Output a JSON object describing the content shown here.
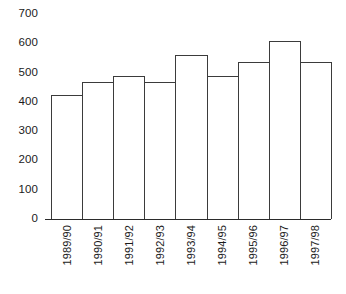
{
  "chart_data": {
    "type": "bar",
    "title": "",
    "subtitle": "",
    "xlabel": "",
    "ylabel": "",
    "categories": [
      "1989/90",
      "1990/91",
      "1991/92",
      "1992/93",
      "1993/94",
      "1994/95",
      "1995/96",
      "1996/97",
      "1997/98"
    ],
    "values": [
      425,
      468,
      490,
      468,
      560,
      490,
      535,
      608,
      535
    ],
    "ylim": [
      0,
      700
    ],
    "y_ticks": [
      0,
      100,
      200,
      300,
      400,
      500,
      600,
      700
    ],
    "y_tick_labels": [
      "0",
      "100",
      "200",
      "300",
      "400",
      "500",
      "600",
      "700"
    ],
    "grid": false,
    "legend": false,
    "legend_position": "none",
    "annotations": [],
    "colors": {
      "bar_fill": "#ffffff",
      "bar_stroke": "#3b3b3b",
      "axis": "#2b2b2b",
      "text": "#1b1b1b",
      "background": "#ffffff"
    }
  }
}
